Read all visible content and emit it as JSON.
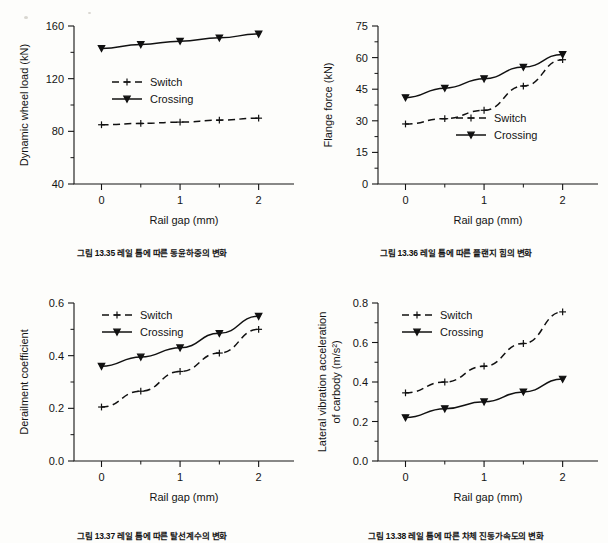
{
  "page": {
    "background_color": "#fdfdfb",
    "ink_color": "#141414"
  },
  "legend_common": {
    "switch_label": "Switch",
    "crossing_label": "Crossing"
  },
  "figures": [
    {
      "id": "fig-13-35",
      "caption": "그림 13.35 레일 틈에 따른 동윤하중의 변화",
      "chart_data": {
        "type": "line",
        "title": "",
        "xlabel": "Rail gap (mm)",
        "ylabel": "Dynamic wheel load (kN)",
        "x": [
          0,
          0.5,
          1,
          1.5,
          2
        ],
        "xlim": [
          -0.35,
          2.45
        ],
        "ylim": [
          40,
          160
        ],
        "xticks": [
          0,
          1,
          2
        ],
        "xtick_labels": [
          "0",
          "1",
          "2"
        ],
        "xminor": [
          0.5,
          1.5
        ],
        "yticks": [
          40,
          80,
          120,
          160
        ],
        "ytick_labels": [
          "40",
          "80",
          "120",
          "160"
        ],
        "yminor": [
          60,
          100,
          140
        ],
        "grid": false,
        "legend_position": "center-left",
        "series": [
          {
            "name": "Switch",
            "style": "dashed",
            "marker": "plus",
            "values": [
              85,
              86,
              87,
              88.5,
              90
            ]
          },
          {
            "name": "Crossing",
            "style": "solid",
            "marker": "triangle-down",
            "values": [
              143,
              146,
              148.5,
              151,
              154
            ]
          }
        ]
      }
    },
    {
      "id": "fig-13-36",
      "caption": "그림 13.36 레일 틈에 따른 플랜지 힘의 변화",
      "chart_data": {
        "type": "line",
        "title": "",
        "xlabel": "Rail gap (mm)",
        "ylabel": "Flange force (kN)",
        "x": [
          0,
          0.5,
          1,
          1.5,
          2
        ],
        "xlim": [
          -0.35,
          2.45
        ],
        "ylim": [
          0,
          75
        ],
        "xticks": [
          0,
          1,
          2
        ],
        "xtick_labels": [
          "0",
          "1",
          "2"
        ],
        "xminor": [
          0.5,
          1.5
        ],
        "yticks": [
          0,
          15,
          30,
          45,
          60,
          75
        ],
        "ytick_labels": [
          "0",
          "15",
          "30",
          "45",
          "60",
          "75"
        ],
        "yminor": [
          7.5,
          22.5,
          37.5,
          52.5,
          67.5
        ],
        "grid": false,
        "legend_position": "center-right",
        "series": [
          {
            "name": "Switch",
            "style": "dashed",
            "marker": "plus",
            "values": [
              28.5,
              31,
              35,
              46.5,
              59
            ]
          },
          {
            "name": "Crossing",
            "style": "solid",
            "marker": "triangle-down",
            "values": [
              41,
              45.5,
              50,
              55.5,
              61.5
            ]
          }
        ]
      }
    },
    {
      "id": "fig-13-37",
      "caption": "그림 13.37 레일 틈에 따른 탈선계수의 변화",
      "chart_data": {
        "type": "line",
        "title": "",
        "xlabel": "Rail gap (mm)",
        "ylabel": "Derailment coefficient",
        "x": [
          0,
          0.5,
          1,
          1.5,
          2
        ],
        "xlim": [
          -0.35,
          2.45
        ],
        "ylim": [
          0.0,
          0.6
        ],
        "xticks": [
          0,
          1,
          2
        ],
        "xtick_labels": [
          "0",
          "1",
          "2"
        ],
        "xminor": [
          0.5,
          1.5
        ],
        "yticks": [
          0.0,
          0.2,
          0.4,
          0.6
        ],
        "ytick_labels": [
          "0.0",
          "0.2",
          "0.4",
          "0.6"
        ],
        "yminor": [
          0.1,
          0.3,
          0.5
        ],
        "grid": false,
        "legend_position": "top-left",
        "series": [
          {
            "name": "Switch",
            "style": "dashed",
            "marker": "plus",
            "values": [
              0.205,
              0.265,
              0.34,
              0.41,
              0.5
            ]
          },
          {
            "name": "Crossing",
            "style": "solid",
            "marker": "triangle-down",
            "values": [
              0.36,
              0.395,
              0.43,
              0.485,
              0.55
            ]
          }
        ]
      }
    },
    {
      "id": "fig-13-38",
      "caption": "그림 13.38 레일 틈에 따른 차체 진동가속도의 변화",
      "chart_data": {
        "type": "line",
        "title": "",
        "xlabel": "Rail gap (mm)",
        "ylabel": "Lateral vibration acceleration of carbody (m/s²)",
        "ylabel_line1": "Lateral vibration acceleration",
        "ylabel_line2": "of carbody (m/s²)",
        "x": [
          0,
          0.5,
          1,
          1.5,
          2
        ],
        "xlim": [
          -0.35,
          2.45
        ],
        "ylim": [
          0.0,
          0.8
        ],
        "xticks": [
          0,
          1,
          2
        ],
        "xtick_labels": [
          "0",
          "1",
          "2"
        ],
        "xminor": [
          0.5,
          1.5
        ],
        "yticks": [
          0.0,
          0.2,
          0.4,
          0.6,
          0.8
        ],
        "ytick_labels": [
          "0.0",
          "0.2",
          "0.4",
          "0.6",
          "0.8"
        ],
        "yminor": [
          0.1,
          0.3,
          0.5,
          0.7
        ],
        "grid": false,
        "legend_position": "top-left",
        "series": [
          {
            "name": "Switch",
            "style": "dashed",
            "marker": "plus",
            "values": [
              0.345,
              0.4,
              0.48,
              0.595,
              0.755
            ]
          },
          {
            "name": "Crossing",
            "style": "solid",
            "marker": "triangle-down",
            "values": [
              0.22,
              0.265,
              0.3,
              0.35,
              0.415
            ]
          }
        ]
      }
    }
  ]
}
